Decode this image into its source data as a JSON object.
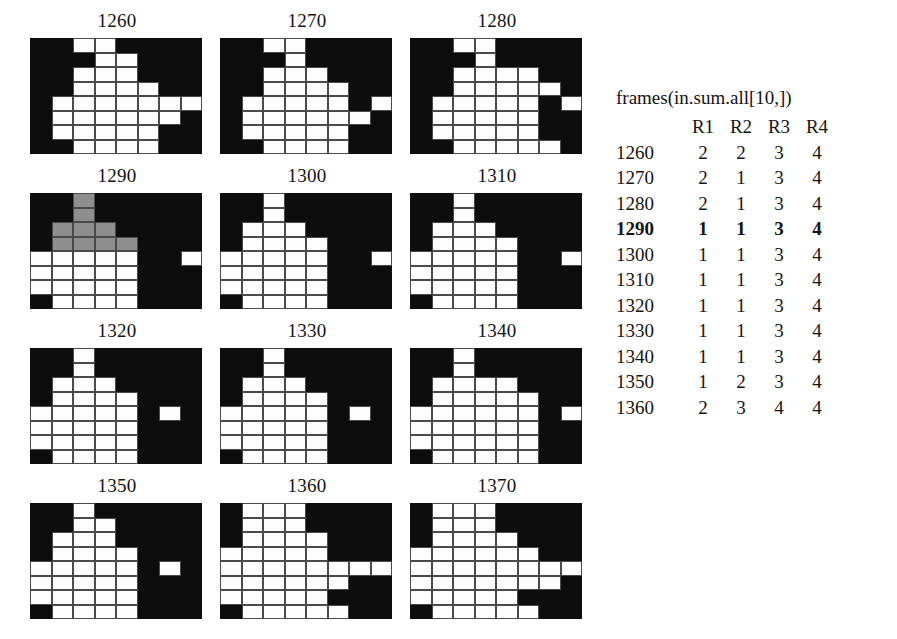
{
  "figure": {
    "type": "raster-panel-grid",
    "panel_columns": 3,
    "panel_rows": 4,
    "cell_grid": {
      "cols": 8,
      "rows": 8
    },
    "legend": {
      "0": "background-black",
      "1": "white-cell",
      "2": "gray-highlight-cell"
    },
    "panels": [
      {
        "label": "1260",
        "cells": [
          [
            0,
            0,
            1,
            1,
            0,
            0,
            0,
            0
          ],
          [
            0,
            0,
            0,
            1,
            1,
            0,
            0,
            0
          ],
          [
            0,
            0,
            1,
            1,
            1,
            0,
            0,
            0
          ],
          [
            0,
            0,
            1,
            1,
            1,
            1,
            0,
            0
          ],
          [
            0,
            1,
            1,
            1,
            1,
            1,
            1,
            1
          ],
          [
            0,
            1,
            1,
            1,
            1,
            1,
            1,
            0
          ],
          [
            0,
            1,
            1,
            1,
            1,
            1,
            0,
            0
          ],
          [
            0,
            0,
            1,
            1,
            1,
            1,
            0,
            0
          ]
        ]
      },
      {
        "label": "1270",
        "cells": [
          [
            0,
            0,
            1,
            1,
            0,
            0,
            0,
            0
          ],
          [
            0,
            0,
            0,
            1,
            0,
            0,
            0,
            0
          ],
          [
            0,
            0,
            1,
            1,
            1,
            0,
            0,
            0
          ],
          [
            0,
            0,
            1,
            1,
            1,
            1,
            0,
            0
          ],
          [
            0,
            1,
            1,
            1,
            1,
            1,
            0,
            1
          ],
          [
            0,
            1,
            1,
            1,
            1,
            1,
            1,
            0
          ],
          [
            0,
            1,
            1,
            1,
            1,
            1,
            0,
            0
          ],
          [
            0,
            0,
            1,
            1,
            1,
            1,
            0,
            0
          ]
        ]
      },
      {
        "label": "1280",
        "cells": [
          [
            0,
            0,
            1,
            1,
            0,
            0,
            0,
            0
          ],
          [
            0,
            0,
            0,
            1,
            0,
            0,
            0,
            0
          ],
          [
            0,
            0,
            1,
            1,
            1,
            1,
            0,
            0
          ],
          [
            0,
            0,
            1,
            1,
            1,
            1,
            1,
            0
          ],
          [
            0,
            1,
            1,
            1,
            1,
            1,
            0,
            1
          ],
          [
            0,
            1,
            1,
            1,
            1,
            1,
            0,
            0
          ],
          [
            0,
            1,
            1,
            1,
            1,
            1,
            0,
            0
          ],
          [
            0,
            0,
            1,
            1,
            1,
            1,
            1,
            0
          ]
        ]
      },
      {
        "label": "1290",
        "cells": [
          [
            0,
            0,
            2,
            0,
            0,
            0,
            0,
            0
          ],
          [
            0,
            0,
            2,
            0,
            0,
            0,
            0,
            0
          ],
          [
            0,
            2,
            2,
            2,
            0,
            0,
            0,
            0
          ],
          [
            0,
            2,
            2,
            2,
            2,
            0,
            0,
            0
          ],
          [
            1,
            1,
            1,
            1,
            1,
            0,
            0,
            1
          ],
          [
            1,
            1,
            1,
            1,
            1,
            0,
            0,
            0
          ],
          [
            1,
            1,
            1,
            1,
            1,
            0,
            0,
            0
          ],
          [
            0,
            1,
            1,
            1,
            1,
            0,
            0,
            0
          ]
        ]
      },
      {
        "label": "1300",
        "cells": [
          [
            0,
            0,
            1,
            0,
            0,
            0,
            0,
            0
          ],
          [
            0,
            0,
            1,
            0,
            0,
            0,
            0,
            0
          ],
          [
            0,
            1,
            1,
            1,
            0,
            0,
            0,
            0
          ],
          [
            0,
            1,
            1,
            1,
            1,
            0,
            0,
            0
          ],
          [
            1,
            1,
            1,
            1,
            1,
            0,
            0,
            1
          ],
          [
            1,
            1,
            1,
            1,
            1,
            0,
            0,
            0
          ],
          [
            1,
            1,
            1,
            1,
            1,
            0,
            0,
            0
          ],
          [
            0,
            1,
            1,
            1,
            1,
            0,
            0,
            0
          ]
        ]
      },
      {
        "label": "1310",
        "cells": [
          [
            0,
            0,
            1,
            0,
            0,
            0,
            0,
            0
          ],
          [
            0,
            0,
            1,
            0,
            0,
            0,
            0,
            0
          ],
          [
            0,
            1,
            1,
            1,
            0,
            0,
            0,
            0
          ],
          [
            0,
            1,
            1,
            1,
            1,
            0,
            0,
            0
          ],
          [
            1,
            1,
            1,
            1,
            1,
            0,
            0,
            1
          ],
          [
            1,
            1,
            1,
            1,
            1,
            0,
            0,
            0
          ],
          [
            1,
            1,
            1,
            1,
            1,
            0,
            0,
            0
          ],
          [
            0,
            1,
            1,
            1,
            1,
            0,
            0,
            0
          ]
        ]
      },
      {
        "label": "1320",
        "cells": [
          [
            0,
            0,
            1,
            0,
            0,
            0,
            0,
            0
          ],
          [
            0,
            0,
            1,
            0,
            0,
            0,
            0,
            0
          ],
          [
            0,
            1,
            1,
            1,
            0,
            0,
            0,
            0
          ],
          [
            0,
            1,
            1,
            1,
            1,
            0,
            0,
            0
          ],
          [
            1,
            1,
            1,
            1,
            1,
            0,
            1,
            0
          ],
          [
            1,
            1,
            1,
            1,
            1,
            0,
            0,
            0
          ],
          [
            1,
            1,
            1,
            1,
            1,
            0,
            0,
            0
          ],
          [
            0,
            1,
            1,
            1,
            1,
            0,
            0,
            0
          ]
        ]
      },
      {
        "label": "1330",
        "cells": [
          [
            0,
            0,
            1,
            0,
            0,
            0,
            0,
            0
          ],
          [
            0,
            0,
            1,
            0,
            0,
            0,
            0,
            0
          ],
          [
            0,
            1,
            1,
            1,
            0,
            0,
            0,
            0
          ],
          [
            0,
            1,
            1,
            1,
            1,
            0,
            0,
            0
          ],
          [
            1,
            1,
            1,
            1,
            1,
            0,
            1,
            0
          ],
          [
            1,
            1,
            1,
            1,
            1,
            0,
            0,
            0
          ],
          [
            1,
            1,
            1,
            1,
            1,
            0,
            0,
            0
          ],
          [
            0,
            1,
            1,
            1,
            1,
            0,
            0,
            0
          ]
        ]
      },
      {
        "label": "1340",
        "cells": [
          [
            0,
            0,
            1,
            0,
            0,
            0,
            0,
            0
          ],
          [
            0,
            0,
            1,
            0,
            0,
            0,
            0,
            0
          ],
          [
            0,
            1,
            1,
            1,
            1,
            0,
            0,
            0
          ],
          [
            0,
            1,
            1,
            1,
            1,
            1,
            0,
            0
          ],
          [
            1,
            1,
            1,
            1,
            1,
            1,
            0,
            1
          ],
          [
            1,
            1,
            1,
            1,
            1,
            1,
            0,
            0
          ],
          [
            1,
            1,
            1,
            1,
            1,
            1,
            0,
            0
          ],
          [
            0,
            1,
            1,
            1,
            1,
            1,
            0,
            0
          ]
        ]
      },
      {
        "label": "1350",
        "cells": [
          [
            0,
            0,
            1,
            0,
            0,
            0,
            0,
            0
          ],
          [
            0,
            0,
            1,
            1,
            0,
            0,
            0,
            0
          ],
          [
            0,
            1,
            1,
            1,
            0,
            0,
            0,
            0
          ],
          [
            0,
            1,
            1,
            1,
            1,
            0,
            0,
            0
          ],
          [
            1,
            1,
            1,
            1,
            1,
            0,
            1,
            0
          ],
          [
            1,
            1,
            1,
            1,
            1,
            0,
            0,
            0
          ],
          [
            1,
            1,
            1,
            1,
            1,
            0,
            0,
            0
          ],
          [
            0,
            1,
            1,
            1,
            1,
            0,
            0,
            0
          ]
        ]
      },
      {
        "label": "1360",
        "cells": [
          [
            0,
            1,
            1,
            1,
            0,
            0,
            0,
            0
          ],
          [
            0,
            1,
            1,
            1,
            0,
            0,
            0,
            0
          ],
          [
            0,
            1,
            1,
            1,
            1,
            0,
            0,
            0
          ],
          [
            1,
            1,
            1,
            1,
            1,
            0,
            0,
            0
          ],
          [
            1,
            1,
            1,
            1,
            1,
            1,
            1,
            1
          ],
          [
            1,
            1,
            1,
            1,
            1,
            1,
            0,
            0
          ],
          [
            1,
            1,
            1,
            1,
            1,
            0,
            0,
            0
          ],
          [
            0,
            1,
            1,
            1,
            1,
            1,
            0,
            0
          ]
        ]
      },
      {
        "label": "1370",
        "cells": [
          [
            0,
            1,
            1,
            1,
            0,
            0,
            0,
            0
          ],
          [
            0,
            1,
            1,
            1,
            0,
            0,
            0,
            0
          ],
          [
            0,
            1,
            1,
            1,
            1,
            0,
            0,
            0
          ],
          [
            1,
            1,
            1,
            1,
            1,
            1,
            0,
            0
          ],
          [
            1,
            1,
            1,
            1,
            1,
            1,
            1,
            1
          ],
          [
            1,
            1,
            1,
            1,
            1,
            1,
            1,
            0
          ],
          [
            1,
            1,
            1,
            1,
            1,
            0,
            0,
            0
          ],
          [
            0,
            1,
            1,
            1,
            1,
            1,
            0,
            0
          ]
        ]
      }
    ]
  },
  "table": {
    "caption": "frames(in.sum.all[10,])",
    "columns": [
      "R1",
      "R2",
      "R3",
      "R4"
    ],
    "rows": [
      {
        "label": "1260",
        "values": [
          "2",
          "2",
          "3",
          "4"
        ],
        "bold": false
      },
      {
        "label": "1270",
        "values": [
          "2",
          "1",
          "3",
          "4"
        ],
        "bold": false
      },
      {
        "label": "1280",
        "values": [
          "2",
          "1",
          "3",
          "4"
        ],
        "bold": false
      },
      {
        "label": "1290",
        "values": [
          "1",
          "1",
          "3",
          "4"
        ],
        "bold": true
      },
      {
        "label": "1300",
        "values": [
          "1",
          "1",
          "3",
          "4"
        ],
        "bold": false
      },
      {
        "label": "1310",
        "values": [
          "1",
          "1",
          "3",
          "4"
        ],
        "bold": false
      },
      {
        "label": "1320",
        "values": [
          "1",
          "1",
          "3",
          "4"
        ],
        "bold": false
      },
      {
        "label": "1330",
        "values": [
          "1",
          "1",
          "3",
          "4"
        ],
        "bold": false
      },
      {
        "label": "1340",
        "values": [
          "1",
          "1",
          "3",
          "4"
        ],
        "bold": false
      },
      {
        "label": "1350",
        "values": [
          "1",
          "2",
          "3",
          "4"
        ],
        "bold": false
      },
      {
        "label": "1360",
        "values": [
          "2",
          "3",
          "4",
          "4"
        ],
        "bold": false
      }
    ]
  },
  "colors": {
    "background": "#ffffff",
    "cell_off": "#0d0d0d",
    "cell_on": "#fdfdfd",
    "cell_highlight": "#8e8e8e",
    "grid_line": "#4a4a4a",
    "text": "#141414"
  }
}
